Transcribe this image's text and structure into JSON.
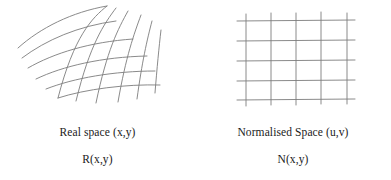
{
  "figure": {
    "kind": "diagram",
    "background_color": "#ffffff",
    "stroke_color": "#7d7d7d",
    "text_color": "#1a1a1a",
    "panels": [
      {
        "id": "real-space",
        "grid_type": "curved-warped-mesh",
        "grid_rows": 6,
        "grid_cols": 6,
        "caption_primary": "Real space (x,y)",
        "caption_secondary": "R(x,y)"
      },
      {
        "id": "normalised-space",
        "grid_type": "regular-rectilinear-grid",
        "grid_rows": 5,
        "grid_cols": 5,
        "caption_primary": "Normalised Space (u,v)",
        "caption_secondary": "N(x,y)"
      }
    ]
  }
}
